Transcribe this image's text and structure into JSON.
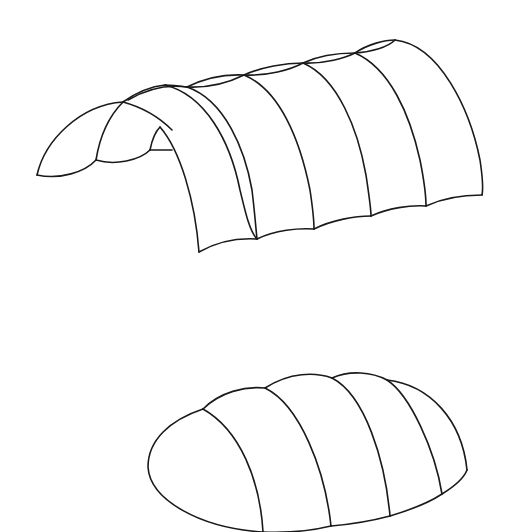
{
  "figure": {
    "stroke_color": "#1a1a1a",
    "background": "#ffffff",
    "shapes": [
      {
        "name": "segmented-barrel-vault",
        "segments": 6,
        "position": "top"
      },
      {
        "name": "segmented-rounded-pod",
        "segments": 5,
        "position": "bottom"
      }
    ]
  }
}
